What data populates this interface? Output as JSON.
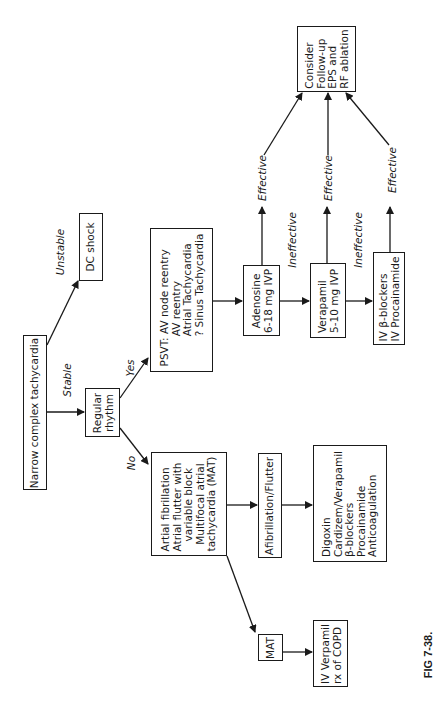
{
  "figure_label": "FIG 7-38.",
  "nodes": {
    "start": "Narrow complex tachycardia",
    "dc_shock": "DC shock",
    "regular_rhythm": "Regular\nrhythm",
    "psvt": "PSVT: AV node reentry\n         AV reentry\n         Atrial Tachycardia\n         ? Sinus Tachycardia",
    "irregular": "Artial fibrillation\nAtrial flutter with\n   variable block\n  Multifocal atrial\ntachycardia (MAT)",
    "adenosine": "Adenosine\n6-18 mg IVP",
    "verapamil": "Verapamil\n5-10 mg IVP",
    "beta_blockers": "IV β-blockers\nIV Procainamide",
    "consider": "Consider\nFollow-up\nEPS and\nRF ablation",
    "afib_flutter": "Afibrillation/Flutter",
    "afib_treatment": "Digoxin\nCardizem/Verapamil\nβ-blockers\nProcainamide\nAnticoagulation",
    "mat": "MAT",
    "mat_treatment": "IV Verpamil\nrx of COPD"
  },
  "edge_labels": {
    "unstable": "Unstable",
    "stable": "Stable",
    "yes": "Yes",
    "no": "No",
    "effective_1": "Effective",
    "effective_2": "Effective",
    "effective_3": "Effective",
    "ineffective_1": "Ineffective",
    "ineffective_2": "Ineffective"
  }
}
